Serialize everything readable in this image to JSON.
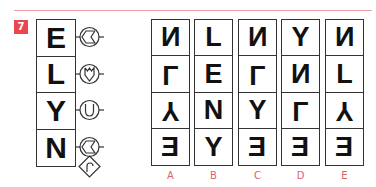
{
  "question_number": "7",
  "colors": {
    "accent": "#e8474f",
    "label": "#e06070",
    "rule": "#e8a0a8"
  },
  "main_stack": {
    "cells": [
      "E",
      "L",
      "Y",
      "N"
    ],
    "symbols": [
      {
        "row": 0,
        "name": "circle-chevron-left-icon",
        "desc": "circle with notched arrow pointing left"
      },
      {
        "row": 1,
        "name": "circle-shield-icon",
        "desc": "circle with downward pointed shield"
      },
      {
        "row": 2,
        "name": "circle-u-icon",
        "desc": "circle with U shape"
      },
      {
        "row": 3,
        "name": "circle-chevron-left-icon",
        "desc": "circle with notched arrow pointing left"
      },
      {
        "row": 3,
        "name": "diamond-hook-icon",
        "desc": "diamond containing an r-shaped hook"
      }
    ]
  },
  "options": [
    {
      "label": "A",
      "cells": [
        {
          "char": "N",
          "transform": "mirror"
        },
        {
          "char": "L",
          "transform": "flip"
        },
        {
          "char": "Y",
          "transform": "flip"
        },
        {
          "char": "E",
          "transform": "mirror"
        }
      ]
    },
    {
      "label": "B",
      "cells": [
        {
          "char": "L",
          "transform": "none"
        },
        {
          "char": "E",
          "transform": "none"
        },
        {
          "char": "N",
          "transform": "none"
        },
        {
          "char": "Y",
          "transform": "none"
        }
      ]
    },
    {
      "label": "C",
      "cells": [
        {
          "char": "N",
          "transform": "mirror"
        },
        {
          "char": "L",
          "transform": "flip"
        },
        {
          "char": "Y",
          "transform": "none"
        },
        {
          "char": "E",
          "transform": "mirror"
        }
      ]
    },
    {
      "label": "D",
      "cells": [
        {
          "char": "Y",
          "transform": "none"
        },
        {
          "char": "N",
          "transform": "mirror"
        },
        {
          "char": "L",
          "transform": "flip"
        },
        {
          "char": "E",
          "transform": "mirror"
        }
      ]
    },
    {
      "label": "E",
      "cells": [
        {
          "char": "N",
          "transform": "mirror"
        },
        {
          "char": "L",
          "transform": "none"
        },
        {
          "char": "Y",
          "transform": "flip"
        },
        {
          "char": "E",
          "transform": "mirror"
        }
      ]
    }
  ]
}
